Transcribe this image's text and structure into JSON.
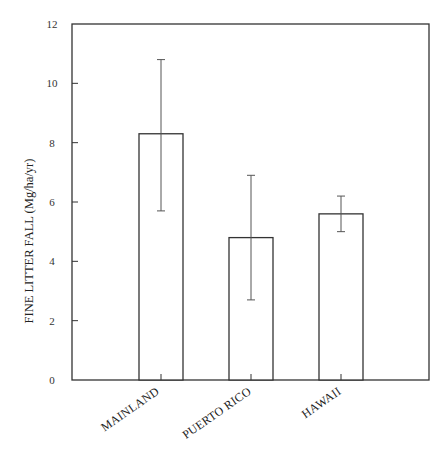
{
  "chart_data": {
    "type": "bar",
    "title": "",
    "xlabel": "",
    "ylabel": "FINE LITTER FALL (Mg/ha/yr)",
    "categories": [
      "MAINLAND",
      "PUERTO RICO",
      "HAWAII"
    ],
    "values": [
      8.3,
      4.8,
      5.6
    ],
    "error_upper": [
      10.8,
      6.9,
      6.2
    ],
    "error_lower": [
      5.7,
      2.7,
      5.0
    ],
    "ylim": [
      0,
      12
    ],
    "yticks": [
      0,
      2,
      4,
      6,
      8,
      10,
      12
    ],
    "ytick_labels": [
      "0",
      "2",
      "4",
      "6",
      "8",
      "10",
      "12"
    ],
    "grid": false,
    "legend": null,
    "bar_fill": "#ffffff",
    "bar_stroke": "#333333"
  }
}
